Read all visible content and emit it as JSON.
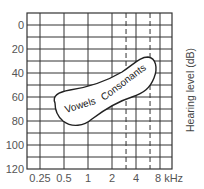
{
  "chart_data": {
    "type": "area",
    "title": "",
    "xlabel": "kHz",
    "ylabel": "Hearing level (dB)",
    "x_scale": "log2",
    "x_ticks": [
      0.25,
      0.5,
      1,
      2,
      4,
      8
    ],
    "x_tick_labels": [
      "0.25",
      "0.5",
      "1",
      "2",
      "4",
      "8 kHz"
    ],
    "x_dashed_lines": [
      3,
      6
    ],
    "y_ticks": [
      0,
      20,
      40,
      60,
      80,
      100,
      120
    ],
    "y_tick_labels": [
      "0",
      "20",
      "40",
      "60",
      "80",
      "100",
      "120"
    ],
    "ylim": [
      -10,
      120
    ],
    "y_inverted": true,
    "grid": true,
    "grid_y_step": 10,
    "regions": [
      {
        "name": "Speech banana",
        "labels": [
          "Vowels",
          "Consonants"
        ],
        "outline": [
          {
            "freq_khz": 0.4,
            "db": 70
          },
          {
            "freq_khz": 1,
            "db": 58
          },
          {
            "freq_khz": 2,
            "db": 47
          },
          {
            "freq_khz": 4.5,
            "db": 30
          },
          {
            "freq_khz": 6,
            "db": 40
          },
          {
            "freq_khz": 4.5,
            "db": 60
          },
          {
            "freq_khz": 2,
            "db": 72
          },
          {
            "freq_khz": 1,
            "db": 85
          },
          {
            "freq_khz": 0.5,
            "db": 82
          }
        ]
      }
    ]
  },
  "labels": {
    "y_axis": "Hearing level (dB)",
    "vowels": "Vowels",
    "consonants": "Consonants"
  }
}
